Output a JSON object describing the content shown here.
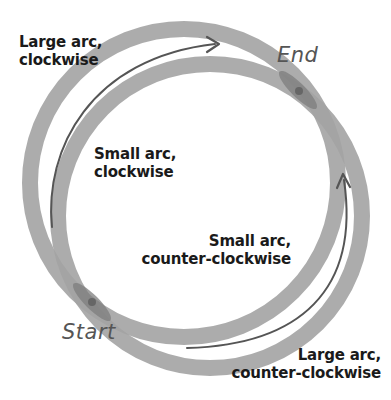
{
  "diagram": {
    "type": "svg-arc-flags",
    "colors": {
      "circle_band": "#a3a3a3",
      "overlap": "#7a7a7a",
      "point": "#6e6e6e",
      "arrow": "#555555",
      "text": "#1a1a1a",
      "hand_text": "#555555"
    },
    "points": {
      "start": {
        "label": "Start",
        "x": 92,
        "y": 302
      },
      "end": {
        "label": "End",
        "x": 298,
        "y": 90
      }
    },
    "labels": {
      "large_cw": {
        "line1": "Large arc,",
        "line2": "clockwise"
      },
      "small_cw": {
        "line1": "Small arc,",
        "line2": "clockwise"
      },
      "small_ccw": {
        "line1": "Small arc,",
        "line2": "counter-clockwise"
      },
      "large_ccw": {
        "line1": "Large arc,",
        "line2": "counter-clockwise"
      }
    }
  }
}
